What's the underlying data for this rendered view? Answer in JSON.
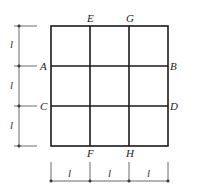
{
  "diagram": {
    "type": "square grid 3x3 with dimension lines",
    "grid": {
      "columns": 3,
      "rows": 3,
      "x_lines": [
        51,
        90,
        129,
        168
      ],
      "y_lines": [
        26,
        66,
        106,
        146
      ]
    },
    "points": {
      "A": "A",
      "B": "B",
      "C": "C",
      "D": "D",
      "E": "E",
      "F": "F",
      "G": "G",
      "H": "H"
    },
    "dimensions": {
      "left": [
        "l",
        "l",
        "l"
      ],
      "bottom": [
        "l",
        "l",
        "l"
      ]
    },
    "colors": {
      "grid": "#1a1a1a",
      "dimension": "#444444"
    }
  }
}
